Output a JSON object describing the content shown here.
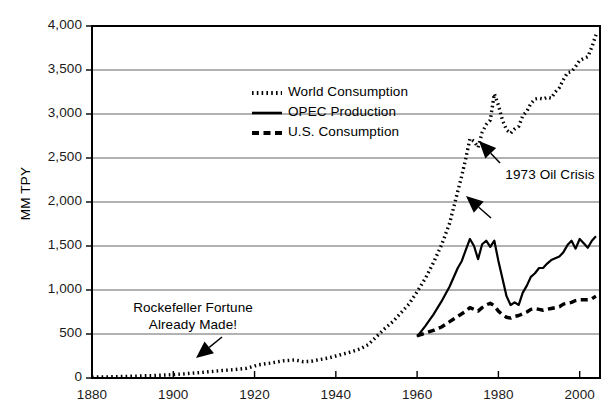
{
  "chart_data": {
    "type": "line",
    "title": "",
    "xlabel": "",
    "ylabel": "MM TPY",
    "xlim": [
      1880,
      2005
    ],
    "ylim": [
      0,
      4000
    ],
    "grid": "horizontal",
    "legend_position": "upper-center-left",
    "ytick_labels": [
      "0",
      "500",
      "1,000",
      "1,500",
      "2,000",
      "2,500",
      "3,000",
      "3,500",
      "4,000"
    ],
    "ytick_values": [
      0,
      500,
      1000,
      1500,
      2000,
      2500,
      3000,
      3500,
      4000
    ],
    "xtick_labels": [
      "1880",
      "1900",
      "1920",
      "1940",
      "1960",
      "1980",
      "2000"
    ],
    "xtick_values": [
      1880,
      1900,
      1920,
      1940,
      1960,
      1980,
      2000
    ],
    "series": [
      {
        "name": "World Consumption",
        "style": "dotted",
        "x": [
          1880,
          1885,
          1890,
          1895,
          1900,
          1903,
          1906,
          1909,
          1912,
          1915,
          1918,
          1921,
          1924,
          1927,
          1930,
          1932,
          1934,
          1936,
          1938,
          1940,
          1942,
          1944,
          1946,
          1948,
          1950,
          1952,
          1954,
          1956,
          1958,
          1960,
          1962,
          1964,
          1966,
          1968,
          1970,
          1971,
          1972,
          1973,
          1974,
          1975,
          1976,
          1977,
          1978,
          1979,
          1980,
          1981,
          1982,
          1983,
          1984,
          1985,
          1986,
          1987,
          1988,
          1989,
          1990,
          1991,
          1992,
          1993,
          1994,
          1995,
          1996,
          1997,
          1998,
          1999,
          2000,
          2001,
          2002,
          2003,
          2004
        ],
        "y": [
          10,
          14,
          20,
          28,
          38,
          48,
          60,
          72,
          85,
          95,
          110,
          150,
          170,
          195,
          205,
          185,
          190,
          210,
          225,
          250,
          275,
          300,
          330,
          380,
          470,
          560,
          640,
          740,
          840,
          980,
          1130,
          1310,
          1510,
          1760,
          2120,
          2300,
          2500,
          2720,
          2690,
          2620,
          2790,
          2880,
          2930,
          3230,
          3100,
          2930,
          2820,
          2780,
          2830,
          2860,
          2980,
          3030,
          3120,
          3170,
          3180,
          3170,
          3190,
          3180,
          3250,
          3300,
          3390,
          3470,
          3480,
          3540,
          3610,
          3630,
          3650,
          3760,
          3900
        ]
      },
      {
        "name": "OPEC Production",
        "style": "solid",
        "x": [
          1960,
          1962,
          1964,
          1966,
          1968,
          1970,
          1971,
          1972,
          1973,
          1974,
          1975,
          1976,
          1977,
          1978,
          1979,
          1980,
          1981,
          1982,
          1983,
          1984,
          1985,
          1986,
          1987,
          1988,
          1989,
          1990,
          1991,
          1992,
          1993,
          1994,
          1995,
          1996,
          1997,
          1998,
          1999,
          2000,
          2001,
          2002,
          2003,
          2004
        ],
        "y": [
          470,
          590,
          720,
          870,
          1040,
          1250,
          1330,
          1460,
          1580,
          1500,
          1350,
          1520,
          1560,
          1490,
          1560,
          1330,
          1130,
          930,
          830,
          860,
          830,
          970,
          1050,
          1150,
          1190,
          1250,
          1250,
          1300,
          1340,
          1360,
          1380,
          1430,
          1510,
          1560,
          1470,
          1580,
          1530,
          1480,
          1560,
          1610
        ]
      },
      {
        "name": "U.S. Consumption",
        "style": "dashed",
        "x": [
          1960,
          1962,
          1964,
          1966,
          1968,
          1970,
          1972,
          1973,
          1974,
          1975,
          1976,
          1977,
          1978,
          1979,
          1980,
          1981,
          1982,
          1983,
          1984,
          1985,
          1986,
          1987,
          1988,
          1989,
          1990,
          1991,
          1992,
          1993,
          1994,
          1995,
          1996,
          1997,
          1998,
          1999,
          2000,
          2001,
          2002,
          2003,
          2004
        ],
        "y": [
          480,
          510,
          540,
          580,
          640,
          700,
          760,
          800,
          780,
          760,
          800,
          830,
          850,
          820,
          760,
          720,
          690,
          680,
          700,
          710,
          730,
          750,
          780,
          790,
          780,
          770,
          780,
          790,
          800,
          810,
          840,
          850,
          860,
          880,
          890,
          890,
          890,
          900,
          930
        ]
      }
    ],
    "annotations": [
      {
        "name": "rockefeller-annotation",
        "lines": [
          "Rockefeller Fortune",
          "Already Made!"
        ],
        "target_x": 1906,
        "target_y": 90
      },
      {
        "name": "oil-crisis-annotation",
        "lines": [
          "1973 Oil Crisis"
        ],
        "target_x": 1974,
        "target_y": 2700
      }
    ]
  },
  "colors": {
    "line": "#000000",
    "grid": "#666666",
    "axis": "#000000",
    "text": "#1a1a1a",
    "background": "#ffffff"
  }
}
